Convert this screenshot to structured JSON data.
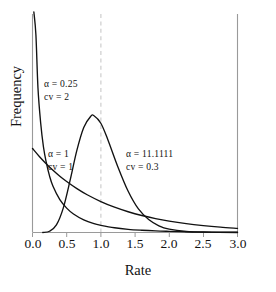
{
  "chart_data": {
    "type": "line",
    "title": "",
    "xlabel": "Rate",
    "ylabel": "Frequency",
    "xlim": [
      0.0,
      3.0
    ],
    "ylim": [
      0.0,
      2.6
    ],
    "xticks": [
      "0.0",
      "0.5",
      "1.0",
      "1.5",
      "2.0",
      "2.5",
      "3.0"
    ],
    "xtick_values": [
      0.0,
      0.5,
      1.0,
      1.5,
      2.0,
      2.5,
      3.0
    ],
    "yticks": [],
    "grid": false,
    "legend_position": "inline-annotations",
    "reference_line": {
      "orientation": "vertical",
      "x": 1.0,
      "style": "dashed",
      "color": "#c9c9c9"
    },
    "series": [
      {
        "name": "alpha = 0.25",
        "alpha": 0.25,
        "cv": 2,
        "color": "#111111",
        "x": [
          0.02,
          0.05,
          0.08,
          0.12,
          0.16,
          0.2,
          0.25,
          0.3,
          0.4,
          0.5,
          0.6,
          0.75,
          0.9,
          1.0,
          1.2,
          1.4,
          1.6,
          1.8,
          2.0,
          2.25,
          2.5,
          2.75,
          3.0
        ],
        "y": [
          3.85,
          2.35,
          1.72,
          1.3,
          1.02,
          0.84,
          0.67,
          0.55,
          0.39,
          0.29,
          0.22,
          0.15,
          0.105,
          0.085,
          0.056,
          0.038,
          0.027,
          0.019,
          0.014,
          0.009,
          0.006,
          0.004,
          0.003
        ]
      },
      {
        "name": "alpha = 1",
        "alpha": 1,
        "cv": 1,
        "color": "#111111",
        "x": [
          0.0,
          0.1,
          0.2,
          0.3,
          0.4,
          0.5,
          0.65,
          0.8,
          1.0,
          1.2,
          1.4,
          1.6,
          1.8,
          2.0,
          2.25,
          2.5,
          2.75,
          3.0
        ],
        "y": [
          1.0,
          0.905,
          0.819,
          0.741,
          0.67,
          0.607,
          0.522,
          0.449,
          0.368,
          0.301,
          0.247,
          0.202,
          0.165,
          0.135,
          0.105,
          0.082,
          0.064,
          0.05
        ]
      },
      {
        "name": "alpha = 11.1111",
        "alpha": 11.1111,
        "cv": 0.3,
        "color": "#111111",
        "x": [
          0.15,
          0.25,
          0.35,
          0.45,
          0.55,
          0.65,
          0.75,
          0.85,
          0.9,
          1.0,
          1.1,
          1.25,
          1.4,
          1.55,
          1.7,
          1.85,
          2.0,
          2.25,
          2.5,
          3.0
        ],
        "y": [
          0.0,
          0.015,
          0.09,
          0.29,
          0.62,
          0.98,
          1.25,
          1.38,
          1.39,
          1.3,
          1.11,
          0.78,
          0.49,
          0.28,
          0.155,
          0.08,
          0.04,
          0.012,
          0.004,
          0.0
        ]
      }
    ],
    "annotations": [
      {
        "id": "ann-alpha-025",
        "lines": [
          "α = 0.25",
          "cv = 2"
        ],
        "x_px": 44,
        "y_px": 78
      },
      {
        "id": "ann-alpha-1",
        "lines": [
          "α = 1",
          "cv = 1"
        ],
        "x_px": 48,
        "y_px": 148
      },
      {
        "id": "ann-alpha-111111",
        "lines": [
          "α = 11.1111",
          "cv = 0.3"
        ],
        "x_px": 126,
        "y_px": 148
      }
    ]
  }
}
